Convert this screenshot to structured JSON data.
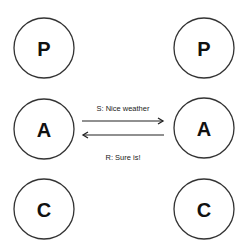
{
  "diagram": {
    "left_column": {
      "nodes": [
        {
          "id": "left-p",
          "label": "P"
        },
        {
          "id": "left-a",
          "label": "A"
        },
        {
          "id": "left-c",
          "label": "C"
        }
      ]
    },
    "right_column": {
      "nodes": [
        {
          "id": "right-p",
          "label": "P"
        },
        {
          "id": "right-a",
          "label": "A"
        },
        {
          "id": "right-c",
          "label": "C"
        }
      ]
    },
    "messages": [
      {
        "label": "S: Nice weather",
        "from": "left-a",
        "to": "right-a",
        "direction": "right"
      },
      {
        "label": "R: Sure is!",
        "from": "right-a",
        "to": "left-a",
        "direction": "left"
      }
    ],
    "colors": {
      "stroke": "#333333",
      "text": "#111111",
      "background": "#ffffff"
    }
  }
}
